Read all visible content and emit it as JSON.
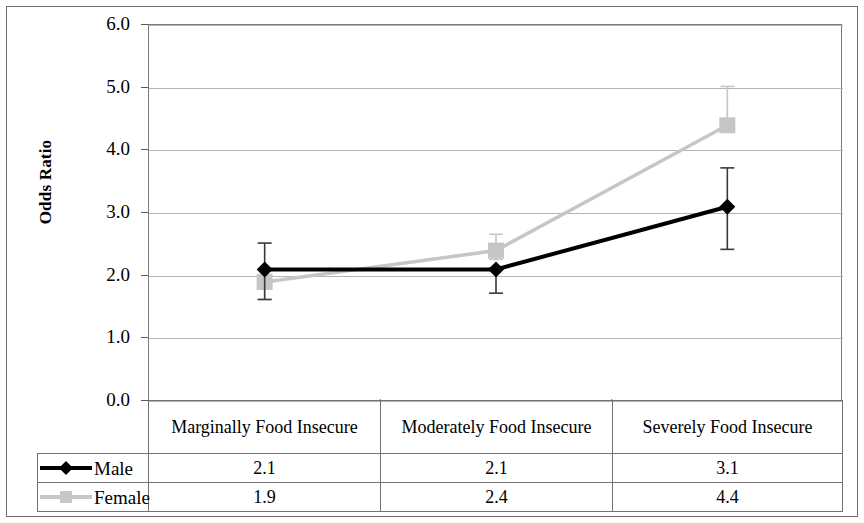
{
  "chart_data": {
    "type": "line",
    "title": "",
    "xlabel": "",
    "ylabel": "Odds Ratio",
    "ylim": [
      0.0,
      6.0
    ],
    "ytick_labels": [
      "6.0",
      "5.0",
      "4.0",
      "3.0",
      "2.0",
      "1.0",
      "0.0"
    ],
    "ytick_values": [
      6.0,
      5.0,
      4.0,
      3.0,
      2.0,
      1.0,
      0.0
    ],
    "grid": true,
    "legend_position": "bottom-table",
    "categories": [
      "Marginally Food Insecure",
      "Moderately Food Insecure",
      "Severely Food Insecure"
    ],
    "series": [
      {
        "name": "Male",
        "color": "#000000",
        "marker": "diamond",
        "values": [
          2.1,
          2.1,
          3.1
        ],
        "value_labels": [
          "2.1",
          "2.1",
          "3.1"
        ],
        "error_low": [
          1.62,
          1.72,
          2.42
        ],
        "error_high": [
          2.52,
          2.12,
          3.72
        ]
      },
      {
        "name": "Female",
        "color": "#c6c6c6",
        "marker": "square",
        "values": [
          1.9,
          2.4,
          4.4
        ],
        "value_labels": [
          "1.9",
          "2.4",
          "4.4"
        ],
        "error_low": [
          1.62,
          2.26,
          4.32
        ],
        "error_high": [
          2.02,
          2.66,
          5.02
        ]
      }
    ]
  },
  "table": {
    "column_headers": [
      "Marginally Food Insecure",
      "Moderately Food Insecure",
      "Severely Food Insecure"
    ],
    "rows": [
      {
        "legend_label": "Male",
        "marker": "diamond-marker",
        "values": [
          "2.1",
          "2.1",
          "3.1"
        ]
      },
      {
        "legend_label": "Female",
        "marker": "square-marker",
        "values": [
          "1.9",
          "2.4",
          "4.4"
        ]
      }
    ]
  },
  "colors": {
    "male_series": "#000000",
    "female_series": "#c6c6c6",
    "gridline": "#b4b4b4",
    "axis": "#7a7a7a",
    "frame": "#6e6e6e"
  }
}
